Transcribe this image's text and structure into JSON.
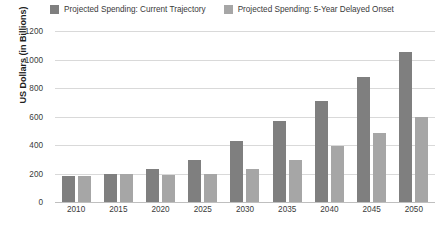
{
  "chart_data": {
    "type": "bar",
    "title": "",
    "xlabel": "",
    "ylabel": "US Dollars (in Billions)",
    "ylim": [
      0,
      1200
    ],
    "yticks": [
      "0",
      "200",
      "400",
      "600",
      "800",
      "1000",
      "1200"
    ],
    "grid": true,
    "legend_position": "top-center",
    "categories": [
      "2010",
      "2015",
      "2020",
      "2025",
      "2030",
      "2035",
      "2040",
      "2045",
      "2050"
    ],
    "series": [
      {
        "name": "Projected Spending: Current Trajectory",
        "color": "#7f7f7f",
        "values": [
          185,
          200,
          235,
          295,
          430,
          570,
          710,
          880,
          1055
        ]
      },
      {
        "name": "Projected Spending: 5-Year Delayed Onset",
        "color": "#a6a6a6",
        "values": [
          185,
          200,
          190,
          195,
          230,
          295,
          390,
          485,
          600
        ]
      }
    ]
  },
  "colors": {
    "series_1": "#7f7f7f",
    "series_2": "#a6a6a6",
    "gridline": "#d9d9d9",
    "axis_text": "#3a3a3a",
    "background": "#ffffff"
  }
}
